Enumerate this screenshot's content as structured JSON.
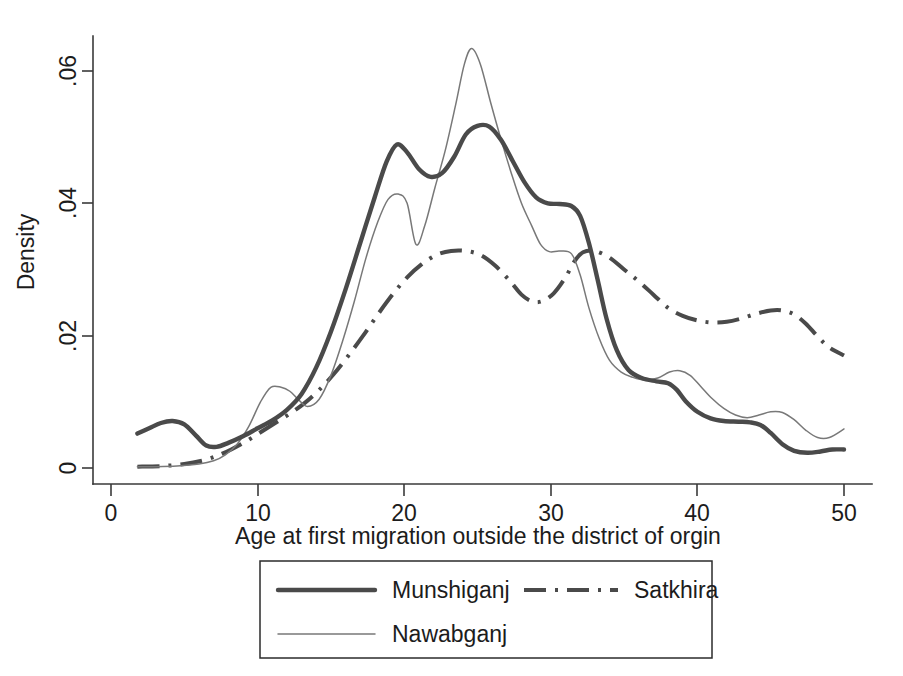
{
  "chart_data": {
    "type": "line",
    "title": "",
    "subtitle": "",
    "xlabel": "Age at first migration outside the district of orgin",
    "ylabel": "Density",
    "xlim": [
      0,
      51
    ],
    "ylim": [
      0,
      0.066
    ],
    "xticks": [
      0,
      10,
      20,
      30,
      40,
      50
    ],
    "xticklabels": [
      "0",
      "10",
      "20",
      "30",
      "40",
      "50"
    ],
    "yticks": [
      0,
      0.02,
      0.04,
      0.06
    ],
    "yticklabels": [
      "0",
      ".02",
      ".04",
      ".06"
    ],
    "grid": false,
    "legend_position": "bottom-center",
    "series": [
      {
        "name": "Munshiganj",
        "style": "solid-thick",
        "color": "#4a4a4a",
        "points": [
          [
            1.8,
            0.0052
          ],
          [
            2.6,
            0.006
          ],
          [
            3.4,
            0.0068
          ],
          [
            4.2,
            0.0071
          ],
          [
            5.0,
            0.0066
          ],
          [
            5.8,
            0.0049
          ],
          [
            6.5,
            0.0034
          ],
          [
            7.2,
            0.0032
          ],
          [
            8.0,
            0.0038
          ],
          [
            9.0,
            0.0048
          ],
          [
            10.0,
            0.006
          ],
          [
            11.0,
            0.0072
          ],
          [
            12.0,
            0.0088
          ],
          [
            13.0,
            0.0112
          ],
          [
            14.0,
            0.0152
          ],
          [
            15.0,
            0.0206
          ],
          [
            16.0,
            0.027
          ],
          [
            17.0,
            0.034
          ],
          [
            18.0,
            0.041
          ],
          [
            18.8,
            0.0463
          ],
          [
            19.5,
            0.0489
          ],
          [
            20.2,
            0.0477
          ],
          [
            21.0,
            0.0452
          ],
          [
            21.8,
            0.044
          ],
          [
            22.6,
            0.0446
          ],
          [
            23.4,
            0.047
          ],
          [
            24.2,
            0.0504
          ],
          [
            25.0,
            0.0517
          ],
          [
            25.8,
            0.0516
          ],
          [
            26.6,
            0.0496
          ],
          [
            27.4,
            0.0464
          ],
          [
            28.2,
            0.0432
          ],
          [
            29.0,
            0.0409
          ],
          [
            29.8,
            0.04
          ],
          [
            30.6,
            0.0399
          ],
          [
            31.4,
            0.0396
          ],
          [
            32.0,
            0.0381
          ],
          [
            32.6,
            0.034
          ],
          [
            33.2,
            0.0284
          ],
          [
            33.8,
            0.0226
          ],
          [
            34.5,
            0.0178
          ],
          [
            35.3,
            0.0148
          ],
          [
            36.2,
            0.0136
          ],
          [
            37.2,
            0.0131
          ],
          [
            38.0,
            0.0128
          ],
          [
            38.6,
            0.0118
          ],
          [
            39.2,
            0.0101
          ],
          [
            40.0,
            0.0085
          ],
          [
            40.9,
            0.0075
          ],
          [
            41.8,
            0.0071
          ],
          [
            42.8,
            0.007
          ],
          [
            43.6,
            0.0069
          ],
          [
            44.3,
            0.0065
          ],
          [
            45.0,
            0.0053
          ],
          [
            45.8,
            0.0036
          ],
          [
            46.6,
            0.0026
          ],
          [
            47.5,
            0.0023
          ],
          [
            48.4,
            0.0025
          ],
          [
            49.2,
            0.0028
          ],
          [
            50.0,
            0.0028
          ]
        ]
      },
      {
        "name": "Nawabganj",
        "style": "solid-thin",
        "color": "#787878",
        "points": [
          [
            1.8,
            0.0002
          ],
          [
            3.0,
            0.0002
          ],
          [
            4.5,
            0.0003
          ],
          [
            6.0,
            0.0006
          ],
          [
            7.0,
            0.0011
          ],
          [
            7.8,
            0.002
          ],
          [
            8.6,
            0.0036
          ],
          [
            9.4,
            0.0063
          ],
          [
            10.2,
            0.01
          ],
          [
            10.9,
            0.0122
          ],
          [
            11.6,
            0.0122
          ],
          [
            12.2,
            0.0116
          ],
          [
            12.8,
            0.0103
          ],
          [
            13.4,
            0.0093
          ],
          [
            14.2,
            0.0104
          ],
          [
            15.0,
            0.014
          ],
          [
            15.8,
            0.0192
          ],
          [
            16.6,
            0.0252
          ],
          [
            17.4,
            0.0318
          ],
          [
            18.2,
            0.0372
          ],
          [
            18.9,
            0.0406
          ],
          [
            19.6,
            0.0414
          ],
          [
            20.2,
            0.04
          ],
          [
            20.8,
            0.0338
          ],
          [
            21.4,
            0.0366
          ],
          [
            22.1,
            0.0424
          ],
          [
            22.8,
            0.048
          ],
          [
            23.5,
            0.0548
          ],
          [
            24.1,
            0.061
          ],
          [
            24.6,
            0.0634
          ],
          [
            25.2,
            0.061
          ],
          [
            25.9,
            0.0552
          ],
          [
            26.6,
            0.0497
          ],
          [
            27.3,
            0.0446
          ],
          [
            28.0,
            0.04
          ],
          [
            28.7,
            0.0366
          ],
          [
            29.3,
            0.0338
          ],
          [
            29.9,
            0.0327
          ],
          [
            30.6,
            0.0328
          ],
          [
            31.4,
            0.0324
          ],
          [
            32.0,
            0.0292
          ],
          [
            32.6,
            0.0242
          ],
          [
            33.3,
            0.0196
          ],
          [
            34.0,
            0.0163
          ],
          [
            34.8,
            0.0145
          ],
          [
            35.6,
            0.0137
          ],
          [
            36.4,
            0.0133
          ],
          [
            37.3,
            0.0136
          ],
          [
            38.1,
            0.0145
          ],
          [
            38.8,
            0.0147
          ],
          [
            39.5,
            0.014
          ],
          [
            40.2,
            0.0124
          ],
          [
            41.0,
            0.0105
          ],
          [
            41.8,
            0.009
          ],
          [
            42.6,
            0.008
          ],
          [
            43.4,
            0.0076
          ],
          [
            44.2,
            0.008
          ],
          [
            45.0,
            0.0085
          ],
          [
            45.8,
            0.0084
          ],
          [
            46.6,
            0.0073
          ],
          [
            47.4,
            0.0057
          ],
          [
            48.2,
            0.0046
          ],
          [
            49.0,
            0.0046
          ],
          [
            50.0,
            0.0059
          ]
        ]
      },
      {
        "name": "Satkhira",
        "style": "dash-dot",
        "color": "#4a4a4a",
        "points": [
          [
            1.8,
            0.0002
          ],
          [
            3.5,
            0.0003
          ],
          [
            5.0,
            0.0006
          ],
          [
            6.2,
            0.0011
          ],
          [
            7.2,
            0.0018
          ],
          [
            8.2,
            0.0028
          ],
          [
            9.2,
            0.004
          ],
          [
            10.2,
            0.0054
          ],
          [
            11.2,
            0.0068
          ],
          [
            12.2,
            0.0082
          ],
          [
            13.2,
            0.0098
          ],
          [
            14.2,
            0.0118
          ],
          [
            15.2,
            0.0142
          ],
          [
            16.2,
            0.017
          ],
          [
            17.2,
            0.02
          ],
          [
            18.2,
            0.0232
          ],
          [
            19.2,
            0.0262
          ],
          [
            20.2,
            0.0288
          ],
          [
            21.2,
            0.0308
          ],
          [
            22.2,
            0.0322
          ],
          [
            23.2,
            0.0328
          ],
          [
            24.2,
            0.0328
          ],
          [
            25.2,
            0.0322
          ],
          [
            26.2,
            0.0306
          ],
          [
            27.2,
            0.0283
          ],
          [
            28.0,
            0.0262
          ],
          [
            28.7,
            0.0252
          ],
          [
            29.4,
            0.0252
          ],
          [
            30.2,
            0.0264
          ],
          [
            31.0,
            0.0288
          ],
          [
            31.6,
            0.0312
          ],
          [
            32.2,
            0.0326
          ],
          [
            33.0,
            0.0328
          ],
          [
            34.0,
            0.0318
          ],
          [
            35.0,
            0.03
          ],
          [
            36.0,
            0.0282
          ],
          [
            37.0,
            0.0262
          ],
          [
            38.0,
            0.0242
          ],
          [
            39.0,
            0.023
          ],
          [
            40.0,
            0.0223
          ],
          [
            41.0,
            0.022
          ],
          [
            42.0,
            0.0221
          ],
          [
            43.0,
            0.0226
          ],
          [
            44.0,
            0.0233
          ],
          [
            45.0,
            0.0238
          ],
          [
            45.8,
            0.0238
          ],
          [
            46.6,
            0.0232
          ],
          [
            47.4,
            0.0218
          ],
          [
            48.2,
            0.0199
          ],
          [
            49.0,
            0.0182
          ],
          [
            50.0,
            0.017
          ]
        ]
      }
    ]
  },
  "axes": {
    "ylabel": "Density",
    "xlabel": "Age at first migration outside the district of orgin",
    "xticklabels": [
      "0",
      "10",
      "20",
      "30",
      "40",
      "50"
    ],
    "yticklabels": [
      "0",
      ".02",
      ".04",
      ".06"
    ]
  },
  "legend": {
    "entries": [
      {
        "label": "Munshiganj",
        "style": "solid-thick"
      },
      {
        "label": "Satkhira",
        "style": "dash-dot"
      },
      {
        "label": "Nawabganj",
        "style": "solid-thin"
      }
    ]
  }
}
